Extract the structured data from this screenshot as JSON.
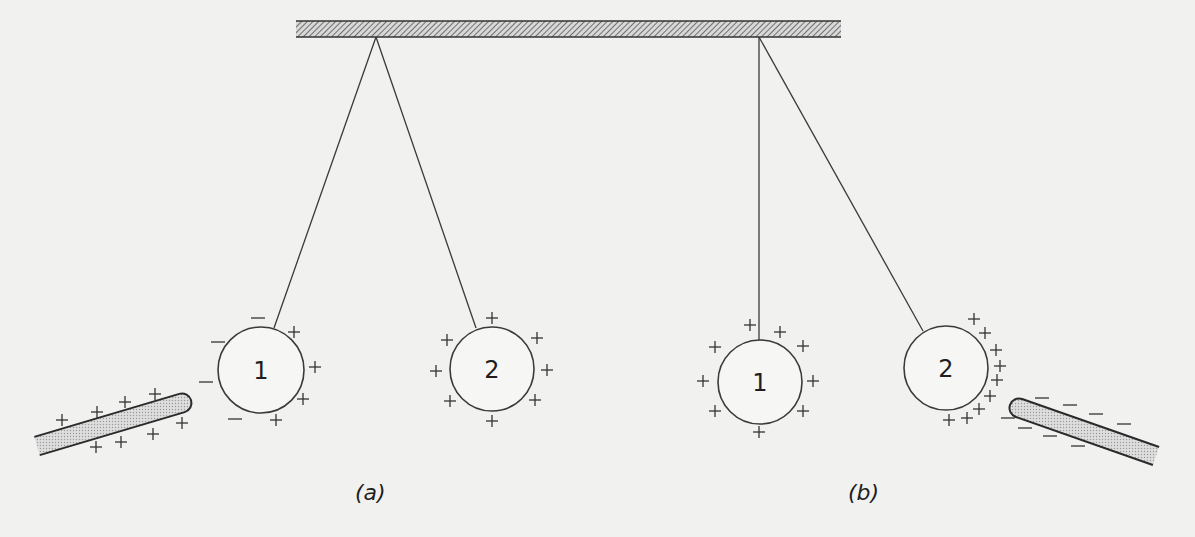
{
  "figure": {
    "ceiling": {
      "x1": 296,
      "x2": 841,
      "y1": 21,
      "y2": 37
    },
    "colors": {
      "background": "#f1f1f0",
      "ink": "#333333",
      "rod_fill": "#cfcfcf"
    }
  },
  "panels": [
    {
      "label": "(a)",
      "label_pos": [
        365,
        500
      ],
      "pivot": [
        376,
        37
      ],
      "spheres": [
        {
          "label": "1",
          "center": [
            261,
            370
          ],
          "r": 43,
          "attach": [
            274,
            328
          ],
          "plus": [
            [
              294,
              332
            ],
            [
              315,
              367
            ],
            [
              303,
              399
            ],
            [
              276,
              420
            ]
          ],
          "minus": [
            [
              258,
              318
            ],
            [
              218,
              342
            ],
            [
              206,
              382
            ],
            [
              235,
              419
            ]
          ]
        },
        {
          "label": "2",
          "center": [
            492,
            369
          ],
          "r": 42,
          "attach": [
            476,
            328
          ],
          "plus": [
            [
              492,
              318
            ],
            [
              447,
              340
            ],
            [
              537,
              338
            ],
            [
              436,
              371
            ],
            [
              547,
              370
            ],
            [
              450,
              401
            ],
            [
              535,
              400
            ],
            [
              492,
              421
            ]
          ],
          "minus": []
        }
      ],
      "rod": {
        "charge": "+",
        "from": [
          37,
          446
        ],
        "to": [
          182,
          403
        ],
        "thickness": 19,
        "signs": [
          [
            62,
            420
          ],
          [
            97,
            412
          ],
          [
            125,
            402
          ],
          [
            155,
            394
          ],
          [
            96,
            447
          ],
          [
            121,
            442
          ],
          [
            153,
            434
          ],
          [
            182,
            423
          ]
        ]
      }
    },
    {
      "label": "(b)",
      "label_pos": [
        858,
        500
      ],
      "pivot": [
        759,
        37
      ],
      "spheres": [
        {
          "label": "1",
          "center": [
            760,
            382
          ],
          "r": 42,
          "attach": [
            759,
            340
          ],
          "plus": [
            [
              750,
              325
            ],
            [
              780,
              332
            ],
            [
              715,
              347
            ],
            [
              803,
              346
            ],
            [
              703,
              381
            ],
            [
              813,
              381
            ],
            [
              715,
              411
            ],
            [
              803,
              411
            ],
            [
              759,
              432
            ]
          ],
          "minus": []
        },
        {
          "label": "2",
          "center": [
            946,
            368
          ],
          "r": 42,
          "attach": [
            923,
            331
          ],
          "plus": [
            [
              974,
              319
            ],
            [
              985,
              333
            ],
            [
              996,
              350
            ],
            [
              1000,
              366
            ],
            [
              997,
              380
            ],
            [
              990,
              396
            ],
            [
              979,
              409
            ],
            [
              967,
              418
            ],
            [
              949,
              420
            ]
          ],
          "minus": []
        }
      ],
      "rod": {
        "charge": "-",
        "from": [
          1019,
          408
        ],
        "to": [
          1156,
          456
        ],
        "thickness": 19,
        "signs": [
          [
            1042,
            398
          ],
          [
            1070,
            405
          ],
          [
            1096,
            414
          ],
          [
            1124,
            424
          ],
          [
            1008,
            418
          ],
          [
            1025,
            428
          ],
          [
            1050,
            436
          ],
          [
            1078,
            446
          ]
        ]
      }
    }
  ],
  "labels": {
    "a": "(a)",
    "b": "(b)",
    "sphere1": "1",
    "sphere2": "2",
    "plus": "+",
    "minus": "—"
  }
}
